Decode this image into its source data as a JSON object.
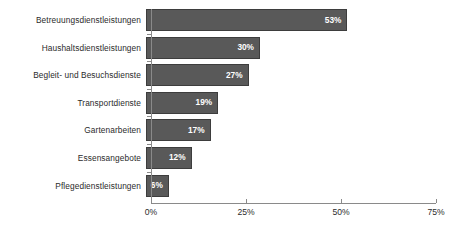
{
  "chart_data": {
    "type": "bar",
    "orientation": "horizontal",
    "title": "",
    "xlabel": "",
    "ylabel": "",
    "categories": [
      "Betreuungsdienstleistungen",
      "Haushaltsdienstleistungen",
      "Begleit- und Besuchsdienste",
      "Transportdienste",
      "Gartenarbeiten",
      "Essensangebote",
      "Pflegedienstleistungen"
    ],
    "values": [
      53,
      30,
      27,
      19,
      17,
      12,
      6
    ],
    "value_labels": [
      "53%",
      "30%",
      "27%",
      "19%",
      "17%",
      "12%",
      "6%"
    ],
    "xlim": [
      0,
      75
    ],
    "xticks": [
      0,
      25,
      50,
      75
    ],
    "xtick_labels": [
      "0%",
      "25%",
      "50%",
      "75%"
    ],
    "grid": false,
    "legend": null,
    "bar_color": "#595959",
    "bar_border_color": "#3d3d3d",
    "value_label_color": "#ffffff",
    "axis_color": "#8a8a8a",
    "background": "#ffffff"
  }
}
